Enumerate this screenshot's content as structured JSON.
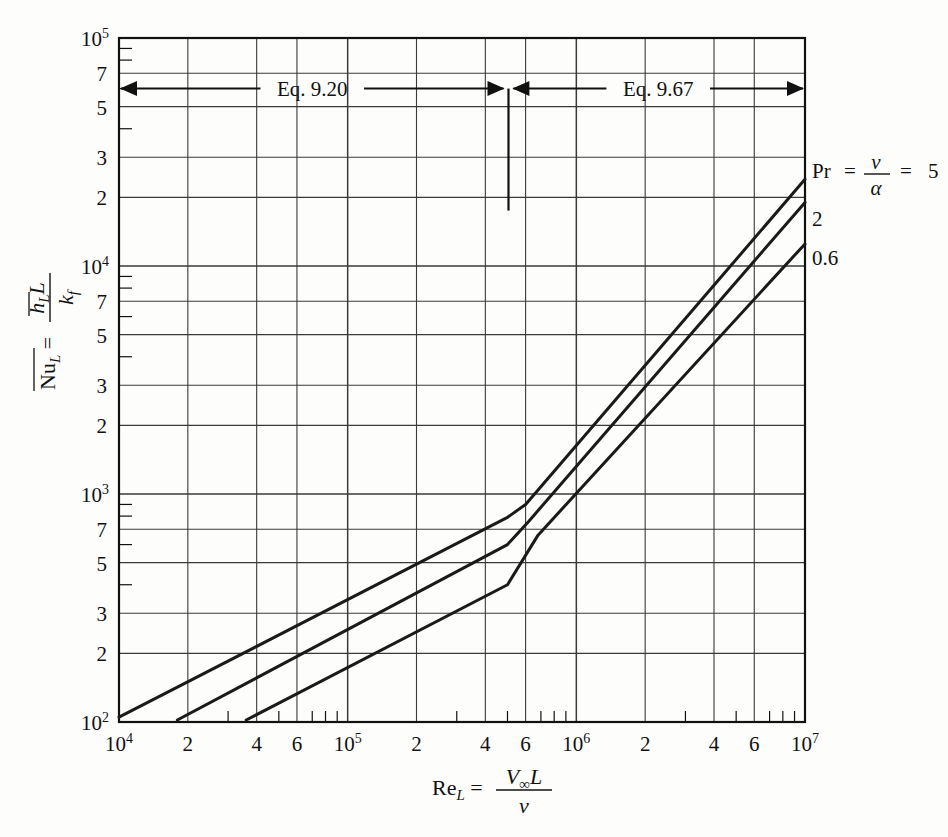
{
  "chart_data": {
    "type": "line",
    "title": "",
    "xlabel": "Re_L = V∞L / ν",
    "ylabel": "Nū_L = h̄_L L / k_f",
    "xscale": "log",
    "yscale": "log",
    "xlim": [
      10000,
      10000000
    ],
    "ylim": [
      100,
      100000
    ],
    "grid": true,
    "legend_position": "right-outside",
    "x_decade_labels": [
      "10⁴",
      "10⁵",
      "10⁶",
      "10⁷"
    ],
    "x_minor_labels": [
      "2",
      "4",
      "6"
    ],
    "y_decade_labels": [
      "10²",
      "10³",
      "10⁴",
      "10⁵"
    ],
    "y_minor_labels": [
      "2",
      "3",
      "5",
      "7"
    ],
    "series": [
      {
        "name": "Pr = 5",
        "legend_text": "5",
        "points": [
          [
            10000,
            105
          ],
          [
            500000,
            790
          ],
          [
            600000,
            900
          ],
          [
            10000000,
            24000
          ]
        ]
      },
      {
        "name": "Pr = 2",
        "legend_text": "2",
        "points": [
          [
            18000,
            102
          ],
          [
            500000,
            600
          ],
          [
            620000,
            760
          ],
          [
            10000000,
            19000
          ]
        ]
      },
      {
        "name": "Pr = 0.6",
        "legend_text": "0.6",
        "points": [
          [
            36000,
            102
          ],
          [
            500000,
            400
          ],
          [
            680000,
            660
          ],
          [
            10000000,
            12500
          ]
        ]
      }
    ],
    "annotations": [
      {
        "id": "eq-920",
        "label": "Eq. 9.20",
        "type": "double-arrow",
        "x_start": 10000,
        "x_end": 490000,
        "y": 60000
      },
      {
        "id": "eq-967",
        "label": "Eq. 9.67",
        "type": "double-arrow",
        "x_start": 520000,
        "x_end": 10000000,
        "y": 60000
      },
      {
        "id": "transition-divider",
        "label": "",
        "type": "vertical-line",
        "x": 505000,
        "y_top": 60000,
        "y_bottom": 17500
      }
    ]
  },
  "axes": {
    "x": {
      "title_prefix": "Re",
      "title_sub": "L",
      "title_equals": "=",
      "numerator": "V",
      "numerator_sub": "∞",
      "numerator_tail": "L",
      "denominator": "ν"
    },
    "y": {
      "title_prefix": "Nu",
      "title_sub": "L",
      "title_equals": "=",
      "numerator": "h",
      "numerator_sub": "L",
      "numerator_tail": "L",
      "denominator": "k",
      "denominator_sub": "f"
    }
  },
  "legend": {
    "header_prefix": "Pr",
    "header_equals1": "=",
    "header_numerator": "ν",
    "header_denominator": "α",
    "header_equals2": "=",
    "header_value": "5",
    "entries": [
      "5",
      "2",
      "0.6"
    ]
  },
  "colors": {
    "curve": "#1a1a1a",
    "grid": "#3a3a3a",
    "axis": "#111111",
    "background": "#fdfdfc"
  }
}
